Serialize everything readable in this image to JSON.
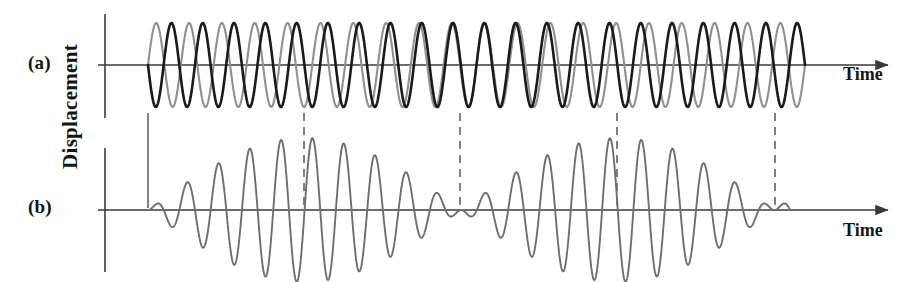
{
  "figure": {
    "panel_a_label": "(a)",
    "panel_b_label": "(b)",
    "y_axis_label": "Displacement",
    "x_axis_label_a": "Time",
    "x_axis_label_b": "Time"
  },
  "colors": {
    "wave1": "#1a1a1a",
    "wave2": "#909090",
    "beat_wave": "#6e6e6e",
    "axis": "#3a3a3a",
    "guide_line": "#4a4a4a",
    "background": "#ffffff",
    "text": "#141414"
  },
  "chart_data": {
    "type": "line",
    "title": "",
    "xlabel": "Time",
    "ylabel": "Displacement",
    "grid": false,
    "legend": "none",
    "panels": [
      {
        "id": "a",
        "label": "(a)",
        "xlabel": "Time",
        "axis_y_px": 65,
        "x_start": 148,
        "x_end": 805,
        "amplitude_px": 42,
        "series": [
          {
            "name": "wave1",
            "color": "#1a1a1a",
            "cycles": 21,
            "amplitude": 1.0,
            "phase_deg": 180,
            "linewidth_px": 2.6
          },
          {
            "name": "wave2",
            "color": "#909090",
            "cycles": 20,
            "amplitude": 1.0,
            "phase_deg": 0,
            "linewidth_px": 2.1
          }
        ]
      },
      {
        "id": "b",
        "label": "(b)",
        "xlabel": "Time",
        "axis_y_px": 210,
        "x_start": 148,
        "x_end": 790,
        "amplitude_px": 72,
        "series": [
          {
            "name": "beat_wave",
            "color": "#6e6e6e",
            "carrier_cycles": 20.5,
            "envelope_cycles": 2.05,
            "amplitude": 1.0,
            "linewidth_px": 1.9
          }
        ]
      }
    ],
    "axis_tick_x_px": 105,
    "arrow_end_x_px": 890,
    "beat_nodes_x_px": [
      148,
      460,
      775
    ],
    "beat_antinodes_x_px": [
      304,
      617
    ],
    "beat_period_px": 313,
    "guide_lines": [
      {
        "x": 148,
        "style": "solid",
        "from_panel": "a",
        "to_panel": "b",
        "marks": "node"
      },
      {
        "x": 304,
        "style": "dashed",
        "from_panel": "a",
        "to_panel": "b",
        "marks": "antinode"
      },
      {
        "x": 460,
        "style": "dashed",
        "from_panel": "a",
        "to_panel": "b",
        "marks": "node"
      },
      {
        "x": 617,
        "style": "dashed",
        "from_panel": "a",
        "to_panel": "b",
        "marks": "antinode"
      },
      {
        "x": 775,
        "style": "dashed",
        "from_panel": "a",
        "to_panel": "b",
        "marks": "node"
      }
    ]
  }
}
